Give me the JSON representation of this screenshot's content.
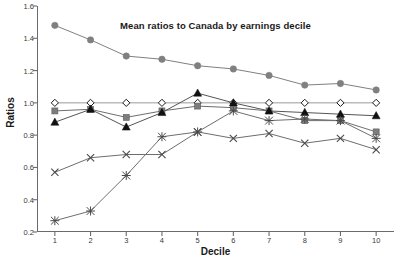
{
  "chart_data": {
    "type": "line",
    "title": "Mean ratios to Canada by earnings decile",
    "xlabel": "Decile",
    "ylabel": "Ratios",
    "x": [
      1,
      2,
      3,
      4,
      5,
      6,
      7,
      8,
      9,
      10
    ],
    "categories": [
      "1",
      "2",
      "3",
      "4",
      "5",
      "6",
      "7",
      "8",
      "9",
      "10"
    ],
    "xlim": [
      0.5,
      10.5
    ],
    "ylim": [
      0.2,
      1.6
    ],
    "ytick_labels": [
      "0.2",
      "0.4",
      "0.6",
      "0.8",
      "1.0",
      "1.2",
      "1.4",
      "1.6"
    ],
    "yticks": [
      0.2,
      0.4,
      0.6,
      0.8,
      1.0,
      1.2,
      1.4,
      1.6
    ],
    "grid": false,
    "legend": "none",
    "series": [
      {
        "name": "gray-circle-series",
        "marker": "circle-filled",
        "color": "#808080",
        "line_color": "#808080",
        "values": [
          1.48,
          1.39,
          1.29,
          1.27,
          1.23,
          1.21,
          1.17,
          1.11,
          1.12,
          1.08
        ]
      },
      {
        "name": "open-diamond-series",
        "marker": "diamond-open",
        "color": "#ffffff",
        "line_color": "#9a9a9a",
        "values": [
          1.0,
          1.0,
          1.0,
          1.0,
          1.0,
          1.0,
          1.0,
          1.0,
          1.0,
          1.0
        ]
      },
      {
        "name": "gray-square-series",
        "marker": "square-filled",
        "color": "#7d7d7d",
        "line_color": "#6e6e6e",
        "values": [
          0.95,
          0.96,
          0.91,
          0.95,
          0.98,
          0.97,
          0.95,
          0.89,
          0.89,
          0.82
        ]
      },
      {
        "name": "black-triangle-series",
        "marker": "triangle-filled",
        "color": "#111111",
        "line_color": "#555555",
        "values": [
          0.88,
          0.96,
          0.85,
          0.94,
          1.06,
          1.0,
          0.95,
          0.94,
          0.93,
          0.92
        ]
      },
      {
        "name": "cross-series",
        "marker": "cross-x",
        "color": "#4a4a4a",
        "line_color": "#6e6e6e",
        "values": [
          0.57,
          0.66,
          0.68,
          0.68,
          0.82,
          0.78,
          0.81,
          0.75,
          0.78,
          0.71
        ]
      },
      {
        "name": "asterisk-series",
        "marker": "asterisk",
        "color": "#4a4a4a",
        "line_color": "#6e6e6e",
        "values": [
          0.27,
          0.33,
          0.55,
          0.79,
          0.82,
          0.95,
          0.89,
          0.9,
          0.89,
          0.78
        ]
      }
    ]
  }
}
